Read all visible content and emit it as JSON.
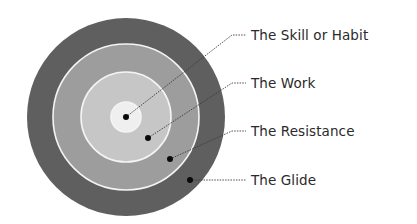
{
  "diagram": {
    "type": "concentric-rings",
    "center": {
      "x": 126,
      "y": 117
    },
    "rings": [
      {
        "name": "outer-ring",
        "radius": 99,
        "color": "#5f5f5f"
      },
      {
        "name": "ring-2",
        "radius": 73,
        "color": "#9d9d9d"
      },
      {
        "name": "ring-3",
        "radius": 45,
        "color": "#c6c6c6"
      },
      {
        "name": "center-ring",
        "radius": 15,
        "color": "#efefef"
      }
    ],
    "separator_color": "#f4f4f4",
    "labels": [
      {
        "text": "The Skill or Habit",
        "dot": [
          126,
          117
        ],
        "bend": [
          232,
          35
        ],
        "end": [
          246,
          35
        ],
        "text_x": 251,
        "text_y": 40
      },
      {
        "text": "The Work",
        "dot": [
          148,
          138
        ],
        "bend": [
          232,
          83
        ],
        "end": [
          246,
          83
        ],
        "text_x": 251,
        "text_y": 88
      },
      {
        "text": "The Resistance",
        "dot": [
          170,
          159
        ],
        "bend": [
          232,
          131
        ],
        "end": [
          246,
          131
        ],
        "text_x": 251,
        "text_y": 136
      },
      {
        "text": "The Glide",
        "dot": [
          190,
          180
        ],
        "bend": [
          232,
          180
        ],
        "end": [
          246,
          180
        ],
        "text_x": 251,
        "text_y": 185
      }
    ]
  }
}
